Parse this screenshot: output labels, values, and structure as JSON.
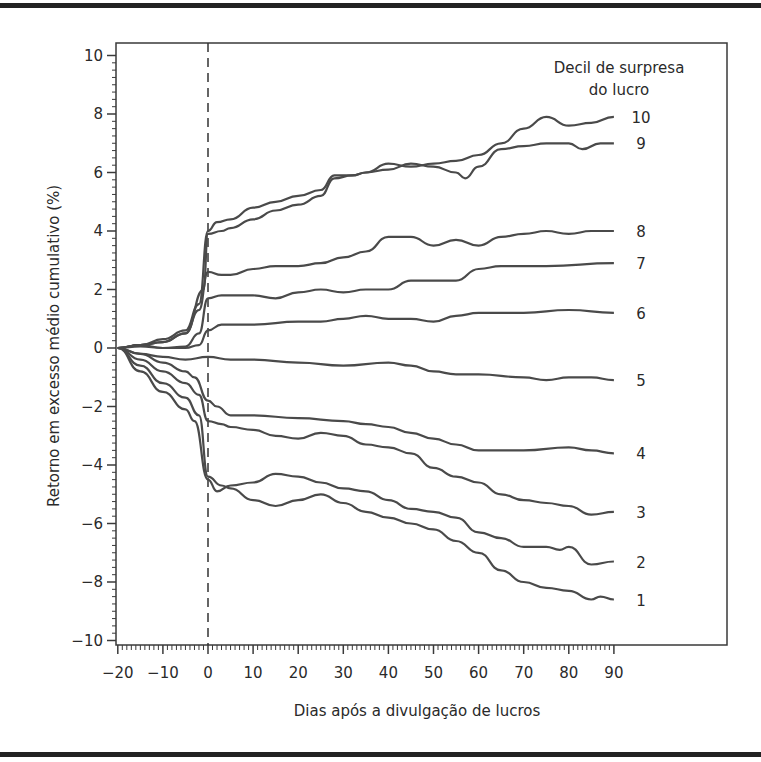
{
  "chart_data": {
    "type": "line",
    "title": "",
    "xlabel": "Dias após a divulgação de lucros",
    "ylabel": "Retorno em excesso médio cumulativo (%)",
    "xlim": [
      -20,
      90
    ],
    "ylim": [
      -10,
      10
    ],
    "x_ticks": [
      -20,
      -10,
      0,
      10,
      20,
      30,
      40,
      50,
      60,
      70,
      80,
      90
    ],
    "x_tick_labels": [
      "−20",
      "−10",
      "0",
      "10",
      "20",
      "30",
      "40",
      "50",
      "60",
      "70",
      "80",
      "90"
    ],
    "y_ticks": [
      10,
      8,
      6,
      4,
      2,
      0,
      -2,
      -4,
      -6,
      -8,
      -10
    ],
    "y_tick_labels": [
      "10",
      "8",
      "6",
      "4",
      "2",
      "0",
      "−2",
      "−4",
      "−6",
      "−8",
      "−10"
    ],
    "grid": false,
    "vertical_reference_line": {
      "x": 0,
      "style": "dashed"
    },
    "legend": {
      "title_line1": "Decil de surpresa",
      "title_line2": "do lucro",
      "position": "top-right, labels at line ends"
    },
    "line_color": "#4a4a4a",
    "series": [
      {
        "name": "10",
        "x": [
          -20,
          -15,
          -10,
          -5,
          -2,
          0,
          2,
          5,
          10,
          15,
          20,
          25,
          28,
          32,
          35,
          40,
          45,
          50,
          55,
          60,
          65,
          70,
          75,
          80,
          85,
          90
        ],
        "values": [
          0,
          0.1,
          0.3,
          0.6,
          1.5,
          4.0,
          4.3,
          4.4,
          4.8,
          5.0,
          5.2,
          5.4,
          5.9,
          5.9,
          6.0,
          6.3,
          6.2,
          6.3,
          6.4,
          6.6,
          7.0,
          7.5,
          7.9,
          7.6,
          7.7,
          7.9
        ]
      },
      {
        "name": "9",
        "x": [
          -20,
          -15,
          -10,
          -5,
          -1,
          0,
          3,
          5,
          10,
          15,
          20,
          25,
          28,
          32,
          35,
          40,
          45,
          50,
          55,
          57,
          60,
          65,
          70,
          75,
          80,
          83,
          87,
          90
        ],
        "values": [
          0,
          0.1,
          0.2,
          0.5,
          2.0,
          3.9,
          4.0,
          4.1,
          4.4,
          4.7,
          4.9,
          5.2,
          5.8,
          5.9,
          6.0,
          6.1,
          6.3,
          6.2,
          6.0,
          5.8,
          6.2,
          6.8,
          6.9,
          7.0,
          7.0,
          6.8,
          7.0,
          7.0
        ]
      },
      {
        "name": "8",
        "x": [
          -20,
          -15,
          -10,
          -5,
          -2,
          0,
          3,
          5,
          10,
          15,
          20,
          25,
          30,
          35,
          40,
          45,
          50,
          55,
          60,
          65,
          70,
          75,
          80,
          85,
          90
        ],
        "values": [
          0,
          0.1,
          0.2,
          0.5,
          1.3,
          2.6,
          2.5,
          2.5,
          2.7,
          2.8,
          2.8,
          2.9,
          3.1,
          3.3,
          3.8,
          3.8,
          3.5,
          3.7,
          3.5,
          3.8,
          3.9,
          4.0,
          3.9,
          4.0,
          4.0
        ]
      },
      {
        "name": "7",
        "x": [
          -20,
          -15,
          -10,
          -5,
          -2,
          0,
          3,
          10,
          15,
          20,
          25,
          30,
          35,
          40,
          45,
          55,
          60,
          65,
          75,
          90
        ],
        "values": [
          0,
          0.05,
          0.0,
          0.05,
          0.5,
          1.7,
          1.8,
          1.8,
          1.7,
          1.9,
          2.0,
          1.9,
          2.0,
          2.0,
          2.3,
          2.3,
          2.7,
          2.8,
          2.8,
          2.9
        ]
      },
      {
        "name": "6",
        "x": [
          -20,
          -15,
          -10,
          -5,
          -2,
          0,
          3,
          10,
          20,
          25,
          30,
          35,
          40,
          45,
          50,
          55,
          60,
          70,
          80,
          90
        ],
        "values": [
          0,
          0.1,
          0.0,
          0.0,
          0.1,
          0.6,
          0.8,
          0.8,
          0.9,
          0.9,
          1.0,
          1.1,
          1.0,
          1.0,
          0.9,
          1.1,
          1.2,
          1.2,
          1.3,
          1.2
        ]
      },
      {
        "name": "5",
        "x": [
          -20,
          -15,
          -10,
          -5,
          0,
          5,
          10,
          20,
          30,
          40,
          45,
          50,
          55,
          60,
          70,
          75,
          80,
          85,
          90
        ],
        "values": [
          0,
          -0.2,
          -0.3,
          -0.4,
          -0.3,
          -0.4,
          -0.4,
          -0.5,
          -0.6,
          -0.5,
          -0.6,
          -0.8,
          -0.9,
          -0.9,
          -1.0,
          -1.1,
          -1.0,
          -1.0,
          -1.1
        ]
      },
      {
        "name": "4",
        "x": [
          -20,
          -15,
          -10,
          -5,
          -3,
          0,
          2,
          5,
          10,
          20,
          30,
          35,
          40,
          45,
          50,
          55,
          60,
          70,
          80,
          85,
          90
        ],
        "values": [
          0,
          -0.2,
          -0.5,
          -0.8,
          -1.0,
          -1.8,
          -2.0,
          -2.3,
          -2.3,
          -2.4,
          -2.5,
          -2.6,
          -2.7,
          -2.9,
          -3.1,
          -3.3,
          -3.5,
          -3.5,
          -3.4,
          -3.5,
          -3.6
        ]
      },
      {
        "name": "3",
        "x": [
          -20,
          -15,
          -10,
          -5,
          -2,
          0,
          3,
          5,
          10,
          15,
          20,
          25,
          30,
          35,
          40,
          45,
          50,
          55,
          60,
          65,
          70,
          75,
          80,
          85,
          90
        ],
        "values": [
          0,
          -0.4,
          -0.8,
          -1.2,
          -1.6,
          -2.5,
          -2.6,
          -2.7,
          -2.8,
          -3.0,
          -3.1,
          -2.9,
          -3.0,
          -3.3,
          -3.4,
          -3.6,
          -4.1,
          -4.4,
          -4.6,
          -5.0,
          -5.2,
          -5.3,
          -5.4,
          -5.7,
          -5.6
        ]
      },
      {
        "name": "2",
        "x": [
          -20,
          -15,
          -10,
          -5,
          -3,
          0,
          2,
          5,
          10,
          15,
          20,
          25,
          30,
          35,
          40,
          45,
          50,
          55,
          60,
          65,
          70,
          75,
          78,
          80,
          85,
          90
        ],
        "values": [
          0,
          -0.8,
          -1.5,
          -2.1,
          -2.5,
          -4.5,
          -4.9,
          -4.7,
          -4.6,
          -4.3,
          -4.4,
          -4.6,
          -4.8,
          -4.9,
          -5.2,
          -5.5,
          -5.6,
          -5.8,
          -6.3,
          -6.5,
          -6.8,
          -6.8,
          -6.9,
          -6.8,
          -7.4,
          -7.3
        ]
      },
      {
        "name": "1",
        "x": [
          -20,
          -15,
          -10,
          -5,
          -2,
          0,
          3,
          5,
          10,
          15,
          20,
          25,
          30,
          35,
          40,
          45,
          50,
          55,
          60,
          65,
          70,
          75,
          80,
          85,
          87,
          90
        ],
        "values": [
          0,
          -0.6,
          -1.2,
          -1.7,
          -2.3,
          -4.4,
          -4.7,
          -4.8,
          -5.2,
          -5.4,
          -5.2,
          -5.0,
          -5.3,
          -5.6,
          -5.8,
          -6.0,
          -6.2,
          -6.6,
          -7.0,
          -7.6,
          -8.0,
          -8.2,
          -8.3,
          -8.6,
          -8.5,
          -8.6
        ]
      }
    ]
  }
}
